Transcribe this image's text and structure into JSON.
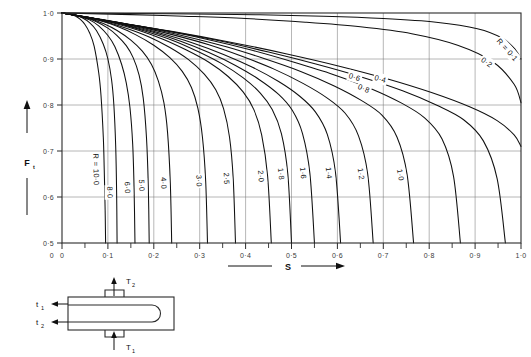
{
  "figure": {
    "background_color": "#ffffff",
    "line_color": "#101010",
    "grid_color": "#7a7a7a",
    "axis_color": "#2a2a2a"
  },
  "axes": {
    "y_title": "F",
    "y_title_sub": "t",
    "x_title": "S",
    "y_ticks": [
      "1·0",
      "0·9",
      "0·8",
      "0·7",
      "0·6",
      "0·5"
    ],
    "y_tick_values": [
      1.0,
      0.9,
      0.8,
      0.7,
      0.6,
      0.5
    ],
    "x_ticks": [
      "0",
      "0·1",
      "0·2",
      "0·3",
      "0·4",
      "0·5",
      "0·6",
      "0·7",
      "0·8",
      "0·9",
      "1·0"
    ],
    "x_tick_values": [
      0,
      0.1,
      0.2,
      0.3,
      0.4,
      0.5,
      0.6,
      0.7,
      0.8,
      0.9,
      1.0
    ],
    "x_minor_tick_values": [
      0.05,
      0.15,
      0.25,
      0.35,
      0.45,
      0.55,
      0.65,
      0.75,
      0.85,
      0.95
    ],
    "xlim": [
      0,
      1.0
    ],
    "ylim": [
      0.5,
      1.0
    ],
    "grid": true,
    "arrow_left_label": "",
    "arrow_right_label": ""
  },
  "curve_label_prefix": "R =",
  "diagram": {
    "name": "shell-and-tube-heat-exchanger",
    "labels": {
      "top": "T",
      "top_sub": "2",
      "bottom": "T",
      "bottom_sub": "1",
      "left_upper": "t",
      "left_upper_sub": "1",
      "left_lower": "t",
      "left_lower_sub": "2"
    }
  },
  "chart_data": {
    "type": "line",
    "xlabel": "S",
    "ylabel": "Ft",
    "xlim": [
      0,
      1.0
    ],
    "ylim": [
      0.5,
      1.0
    ],
    "grid": true,
    "legend": "inline curve labels",
    "parameter_name": "R",
    "series": [
      {
        "name": "R = 10·0",
        "label": "R = 10·0",
        "label_prefix": "R =",
        "label_value": "10·0",
        "R": 10.0,
        "x": [
          0.0,
          0.01,
          0.02,
          0.03,
          0.04,
          0.05,
          0.06,
          0.07,
          0.08,
          0.085,
          0.09,
          0.092,
          0.094,
          0.095
        ],
        "y": [
          1.0,
          0.999,
          0.997,
          0.993,
          0.986,
          0.975,
          0.957,
          0.928,
          0.87,
          0.82,
          0.73,
          0.66,
          0.57,
          0.5
        ]
      },
      {
        "name": "8·0",
        "label": "8·0",
        "R": 8.0,
        "x": [
          0.0,
          0.015,
          0.03,
          0.045,
          0.06,
          0.075,
          0.09,
          0.1,
          0.108,
          0.113,
          0.117,
          0.119,
          0.12
        ],
        "y": [
          1.0,
          0.998,
          0.995,
          0.989,
          0.979,
          0.962,
          0.932,
          0.9,
          0.855,
          0.8,
          0.71,
          0.61,
          0.5
        ]
      },
      {
        "name": "6·0",
        "label": "6·0",
        "R": 6.0,
        "x": [
          0.0,
          0.02,
          0.04,
          0.06,
          0.08,
          0.1,
          0.115,
          0.13,
          0.14,
          0.148,
          0.154,
          0.157,
          0.159
        ],
        "y": [
          1.0,
          0.997,
          0.992,
          0.985,
          0.972,
          0.951,
          0.927,
          0.888,
          0.848,
          0.795,
          0.715,
          0.62,
          0.5
        ]
      },
      {
        "name": "5·0",
        "label": "5·0",
        "R": 5.0,
        "x": [
          0.0,
          0.025,
          0.05,
          0.075,
          0.1,
          0.12,
          0.14,
          0.155,
          0.168,
          0.177,
          0.184,
          0.188,
          0.19
        ],
        "y": [
          1.0,
          0.996,
          0.99,
          0.981,
          0.967,
          0.951,
          0.929,
          0.903,
          0.865,
          0.815,
          0.73,
          0.625,
          0.5
        ]
      },
      {
        "name": "4·0",
        "label": "4·0",
        "R": 4.0,
        "x": [
          0.0,
          0.03,
          0.06,
          0.09,
          0.12,
          0.15,
          0.175,
          0.195,
          0.21,
          0.222,
          0.23,
          0.236,
          0.239
        ],
        "y": [
          1.0,
          0.995,
          0.988,
          0.977,
          0.962,
          0.941,
          0.917,
          0.888,
          0.852,
          0.805,
          0.74,
          0.63,
          0.5
        ]
      },
      {
        "name": "3·0",
        "label": "3·0",
        "R": 3.0,
        "x": [
          0.0,
          0.04,
          0.08,
          0.12,
          0.16,
          0.2,
          0.235,
          0.262,
          0.282,
          0.296,
          0.306,
          0.313,
          0.317
        ],
        "y": [
          1.0,
          0.993,
          0.984,
          0.971,
          0.953,
          0.93,
          0.903,
          0.873,
          0.838,
          0.793,
          0.73,
          0.635,
          0.5
        ]
      },
      {
        "name": "2·5",
        "label": "2·5",
        "R": 2.5,
        "x": [
          0.0,
          0.045,
          0.09,
          0.14,
          0.19,
          0.235,
          0.275,
          0.31,
          0.335,
          0.352,
          0.365,
          0.373,
          0.378
        ],
        "y": [
          1.0,
          0.992,
          0.982,
          0.967,
          0.948,
          0.925,
          0.899,
          0.867,
          0.833,
          0.792,
          0.73,
          0.64,
          0.5
        ]
      },
      {
        "name": "2·0",
        "label": "2·0",
        "R": 2.0,
        "x": [
          0.0,
          0.055,
          0.11,
          0.165,
          0.22,
          0.27,
          0.32,
          0.362,
          0.395,
          0.418,
          0.435,
          0.448,
          0.456
        ],
        "y": [
          1.0,
          0.991,
          0.979,
          0.963,
          0.943,
          0.92,
          0.893,
          0.862,
          0.828,
          0.79,
          0.735,
          0.645,
          0.5
        ]
      },
      {
        "name": "1·8",
        "label": "1·8",
        "R": 1.8,
        "x": [
          0.0,
          0.06,
          0.12,
          0.18,
          0.24,
          0.295,
          0.348,
          0.395,
          0.432,
          0.458,
          0.478,
          0.492,
          0.5
        ],
        "y": [
          1.0,
          0.99,
          0.978,
          0.961,
          0.941,
          0.917,
          0.89,
          0.859,
          0.826,
          0.79,
          0.738,
          0.65,
          0.5
        ]
      },
      {
        "name": "1·6",
        "label": "1·6",
        "R": 1.6,
        "x": [
          0.0,
          0.065,
          0.13,
          0.195,
          0.26,
          0.32,
          0.378,
          0.43,
          0.472,
          0.502,
          0.524,
          0.54,
          0.55
        ],
        "y": [
          1.0,
          0.989,
          0.976,
          0.959,
          0.938,
          0.914,
          0.886,
          0.855,
          0.823,
          0.788,
          0.738,
          0.652,
          0.5
        ]
      },
      {
        "name": "1·4",
        "label": "1·4",
        "R": 1.4,
        "x": [
          0.0,
          0.07,
          0.145,
          0.215,
          0.285,
          0.352,
          0.415,
          0.472,
          0.518,
          0.552,
          0.578,
          0.596,
          0.607
        ],
        "y": [
          1.0,
          0.988,
          0.974,
          0.956,
          0.935,
          0.91,
          0.882,
          0.851,
          0.819,
          0.785,
          0.736,
          0.652,
          0.5
        ]
      },
      {
        "name": "1·2",
        "label": "1·2",
        "R": 1.2,
        "x": [
          0.0,
          0.08,
          0.16,
          0.24,
          0.32,
          0.392,
          0.462,
          0.525,
          0.578,
          0.617,
          0.646,
          0.666,
          0.678
        ],
        "y": [
          1.0,
          0.987,
          0.972,
          0.953,
          0.931,
          0.906,
          0.878,
          0.847,
          0.815,
          0.782,
          0.733,
          0.65,
          0.5
        ]
      },
      {
        "name": "1·0",
        "label": "1·0",
        "R": 1.0,
        "x": [
          0.0,
          0.09,
          0.18,
          0.27,
          0.36,
          0.44,
          0.52,
          0.592,
          0.652,
          0.697,
          0.73,
          0.752,
          0.766
        ],
        "y": [
          1.0,
          0.985,
          0.969,
          0.949,
          0.926,
          0.901,
          0.873,
          0.842,
          0.81,
          0.778,
          0.73,
          0.648,
          0.5
        ]
      },
      {
        "name": "0·8",
        "label": "0·8",
        "R": 0.8,
        "x": [
          0.0,
          0.1,
          0.205,
          0.31,
          0.41,
          0.502,
          0.592,
          0.672,
          0.74,
          0.79,
          0.828,
          0.853,
          0.868
        ],
        "y": [
          1.0,
          0.983,
          0.965,
          0.944,
          0.92,
          0.894,
          0.866,
          0.836,
          0.804,
          0.772,
          0.726,
          0.645,
          0.5
        ]
      },
      {
        "name": "0·6",
        "label": "0·6",
        "R": 0.6,
        "x": [
          0.0,
          0.11,
          0.225,
          0.34,
          0.45,
          0.553,
          0.652,
          0.742,
          0.818,
          0.875,
          0.918,
          0.948,
          0.966
        ],
        "y": [
          1.0,
          0.981,
          0.962,
          0.94,
          0.915,
          0.889,
          0.861,
          0.831,
          0.799,
          0.768,
          0.722,
          0.64,
          0.5
        ]
      },
      {
        "name": "0·4",
        "label": "0·4",
        "R": 0.4,
        "x": [
          0.0,
          0.12,
          0.245,
          0.37,
          0.49,
          0.602,
          0.708,
          0.805,
          0.888,
          0.948,
          0.985,
          1.0
        ],
        "y": [
          1.0,
          0.979,
          0.959,
          0.936,
          0.911,
          0.885,
          0.857,
          0.827,
          0.796,
          0.766,
          0.735,
          0.71
        ]
      },
      {
        "name": "0·2",
        "label": "0·2",
        "R": 0.2,
        "x": [
          0.0,
          0.13,
          0.265,
          0.4,
          0.53,
          0.65,
          0.762,
          0.862,
          0.94,
          0.985,
          1.0
        ],
        "y": [
          1.0,
          0.997,
          0.993,
          0.988,
          0.98,
          0.97,
          0.955,
          0.93,
          0.893,
          0.845,
          0.805
        ]
      },
      {
        "name": "R = 0·1",
        "label": "R = 0·1",
        "label_prefix": "R =",
        "label_value": "0·1",
        "R": 0.1,
        "x": [
          0.0,
          0.14,
          0.285,
          0.43,
          0.57,
          0.7,
          0.815,
          0.905,
          0.96,
          0.988,
          1.0
        ],
        "y": [
          1.0,
          0.999,
          0.998,
          0.996,
          0.993,
          0.988,
          0.98,
          0.966,
          0.945,
          0.92,
          0.9
        ]
      }
    ]
  }
}
